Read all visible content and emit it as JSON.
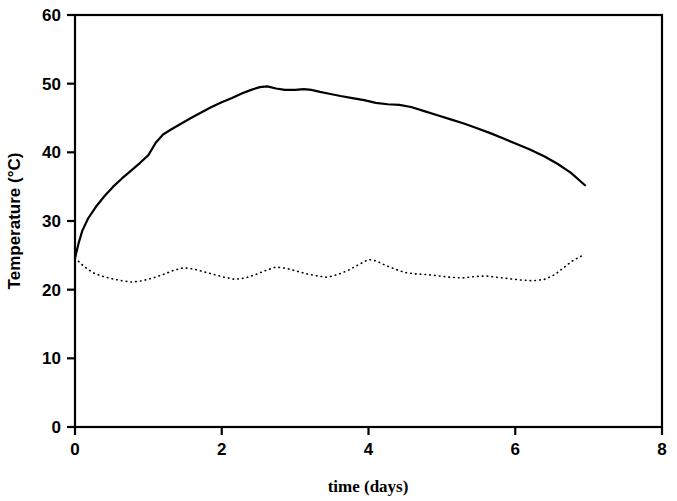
{
  "chart_data": {
    "type": "line",
    "title": "",
    "subtitle": "",
    "xlabel": "time (days)",
    "ylabel": "Temperature (°C)",
    "xlim": [
      0,
      8
    ],
    "ylim": [
      0,
      60
    ],
    "xticks": [
      0,
      2,
      4,
      6,
      8
    ],
    "xtick_labels": [
      "0",
      "2",
      "4",
      "6",
      "8"
    ],
    "yticks": [
      0,
      10,
      20,
      30,
      40,
      50,
      60
    ],
    "ytick_labels": [
      "0",
      "10",
      "20",
      "30",
      "40",
      "50",
      "60"
    ],
    "grid": false,
    "legend": null,
    "legend_position": "none",
    "annotations": [],
    "frame": "box",
    "series": [
      {
        "name": "solid-curve",
        "style": "solid",
        "color": "#000000",
        "linewidth": 2.2,
        "x": [
          0.0,
          0.05,
          0.1,
          0.18,
          0.28,
          0.4,
          0.52,
          0.64,
          0.76,
          0.88,
          1.0,
          1.1,
          1.2,
          1.32,
          1.45,
          1.58,
          1.72,
          1.86,
          2.0,
          2.14,
          2.28,
          2.4,
          2.52,
          2.62,
          2.74,
          2.86,
          3.0,
          3.12,
          3.22,
          3.34,
          3.48,
          3.62,
          3.78,
          3.94,
          4.1,
          4.26,
          4.42,
          4.58,
          4.76,
          4.94,
          5.12,
          5.3,
          5.48,
          5.66,
          5.84,
          6.02,
          6.2,
          6.4,
          6.58,
          6.76,
          6.95
        ],
        "y": [
          24.6,
          26.8,
          28.6,
          30.4,
          32.0,
          33.6,
          35.0,
          36.2,
          37.3,
          38.4,
          39.6,
          41.4,
          42.6,
          43.4,
          44.2,
          45.0,
          45.8,
          46.6,
          47.3,
          47.9,
          48.6,
          49.1,
          49.5,
          49.6,
          49.3,
          49.1,
          49.1,
          49.2,
          49.1,
          48.8,
          48.5,
          48.2,
          47.9,
          47.6,
          47.2,
          47.0,
          46.9,
          46.6,
          46.0,
          45.4,
          44.8,
          44.2,
          43.5,
          42.8,
          42.0,
          41.2,
          40.4,
          39.4,
          38.3,
          37.0,
          35.2
        ]
      },
      {
        "name": "dotted-curve",
        "style": "dotted",
        "color": "#000000",
        "linewidth": 1.6,
        "x": [
          0.0,
          0.12,
          0.24,
          0.36,
          0.5,
          0.64,
          0.78,
          0.92,
          1.06,
          1.2,
          1.34,
          1.48,
          1.62,
          1.76,
          1.9,
          2.04,
          2.18,
          2.32,
          2.46,
          2.6,
          2.74,
          2.88,
          3.02,
          3.16,
          3.3,
          3.44,
          3.58,
          3.72,
          3.86,
          4.0,
          4.1,
          4.22,
          4.36,
          4.5,
          4.64,
          4.8,
          4.96,
          5.12,
          5.28,
          5.44,
          5.6,
          5.76,
          5.92,
          6.08,
          6.24,
          6.4,
          6.54,
          6.66,
          6.78,
          6.92
        ],
        "y": [
          24.6,
          23.4,
          22.5,
          22.0,
          21.6,
          21.3,
          21.1,
          21.3,
          21.7,
          22.2,
          22.8,
          23.2,
          23.0,
          22.6,
          22.2,
          21.8,
          21.5,
          21.7,
          22.2,
          22.8,
          23.3,
          23.1,
          22.7,
          22.3,
          22.0,
          21.8,
          22.2,
          22.8,
          23.6,
          24.4,
          24.2,
          23.6,
          23.0,
          22.5,
          22.3,
          22.2,
          22.0,
          21.8,
          21.7,
          21.9,
          22.0,
          21.8,
          21.6,
          21.4,
          21.3,
          21.5,
          22.2,
          23.2,
          24.2,
          25.0
        ]
      }
    ]
  },
  "axis_geometry": {
    "left_px": 75,
    "right_px": 662,
    "top_px": 15,
    "bottom_px": 427
  }
}
